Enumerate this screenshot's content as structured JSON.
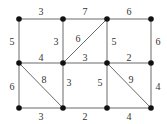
{
  "diagram": {
    "type": "weighted-graph",
    "nodes": [
      {
        "id": "a1",
        "x": 19,
        "y": 19
      },
      {
        "id": "a2",
        "x": 63,
        "y": 19
      },
      {
        "id": "a3",
        "x": 107,
        "y": 19
      },
      {
        "id": "a4",
        "x": 151,
        "y": 19
      },
      {
        "id": "b1",
        "x": 19,
        "y": 63
      },
      {
        "id": "b2",
        "x": 63,
        "y": 63
      },
      {
        "id": "b3",
        "x": 107,
        "y": 63
      },
      {
        "id": "b4",
        "x": 151,
        "y": 63
      },
      {
        "id": "c1",
        "x": 19,
        "y": 108
      },
      {
        "id": "c2",
        "x": 63,
        "y": 108
      },
      {
        "id": "c3",
        "x": 107,
        "y": 108
      },
      {
        "id": "c4",
        "x": 151,
        "y": 108
      }
    ],
    "edges": [
      {
        "from": "a1",
        "to": "a2",
        "weight": "3",
        "lx": 41,
        "ly": 15
      },
      {
        "from": "a2",
        "to": "a3",
        "weight": "7",
        "lx": 85,
        "ly": 15
      },
      {
        "from": "a3",
        "to": "a4",
        "weight": "6",
        "lx": 129,
        "ly": 15
      },
      {
        "from": "a1",
        "to": "b1",
        "weight": "5",
        "lx": 12,
        "ly": 45
      },
      {
        "from": "a2",
        "to": "b2",
        "weight": "3",
        "lx": 56,
        "ly": 45
      },
      {
        "from": "a3",
        "to": "b3",
        "weight": "5",
        "lx": 114,
        "ly": 45
      },
      {
        "from": "a4",
        "to": "b4",
        "weight": "6",
        "lx": 158,
        "ly": 45
      },
      {
        "from": "b2",
        "to": "a3",
        "weight": "6",
        "lx": 78,
        "ly": 42
      },
      {
        "from": "b1",
        "to": "b2",
        "weight": "4",
        "lx": 41,
        "ly": 61
      },
      {
        "from": "b2",
        "to": "b3",
        "weight": "3",
        "lx": 85,
        "ly": 61
      },
      {
        "from": "b3",
        "to": "b4",
        "weight": "2",
        "lx": 129,
        "ly": 61
      },
      {
        "from": "b1",
        "to": "c1",
        "weight": "6",
        "lx": 12,
        "ly": 90
      },
      {
        "from": "b2",
        "to": "c2",
        "weight": "3",
        "lx": 69,
        "ly": 86
      },
      {
        "from": "b3",
        "to": "c3",
        "weight": "5",
        "lx": 100,
        "ly": 86
      },
      {
        "from": "b4",
        "to": "c4",
        "weight": "4",
        "lx": 158,
        "ly": 90
      },
      {
        "from": "b1",
        "to": "c2",
        "weight": "8",
        "lx": 44,
        "ly": 83
      },
      {
        "from": "b3",
        "to": "c4",
        "weight": "9",
        "lx": 131,
        "ly": 83
      },
      {
        "from": "c1",
        "to": "c2",
        "weight": "3",
        "lx": 41,
        "ly": 120
      },
      {
        "from": "c2",
        "to": "c3",
        "weight": "2",
        "lx": 85,
        "ly": 120
      },
      {
        "from": "c3",
        "to": "c4",
        "weight": "4",
        "lx": 129,
        "ly": 120
      }
    ]
  }
}
